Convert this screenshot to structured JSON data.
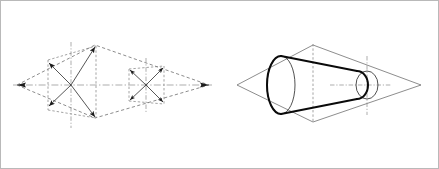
{
  "page": {
    "background_color": "#ffffff",
    "border_color": "#b9b9b9",
    "width": 439,
    "height": 169
  },
  "figures": [
    {
      "id": "figure-left",
      "name": "rhombus-with-inscribed-square-crosses",
      "description": "Isometric rhombus outline containing two dashed squares, each with a four-arrow diagonal cross and dash-dot centerlines",
      "line_color": "#6f6f6f",
      "arrow_color": "#1c1c1c",
      "outline": {
        "type": "rhombus",
        "style": "dashed",
        "vertices": [
          {
            "label": "left",
            "x": 17,
            "y": 85
          },
          {
            "label": "top",
            "x": 95,
            "y": 45
          },
          {
            "label": "right",
            "x": 209,
            "y": 85
          },
          {
            "label": "bottom",
            "x": 95,
            "y": 118
          }
        ]
      },
      "axes": [
        {
          "label": "horizontal-axis",
          "style": "dash-dot",
          "x1": 17,
          "y1": 85,
          "x2": 209,
          "y2": 85
        },
        {
          "label": "vertical-axis-large",
          "style": "dash-dot",
          "x1": 71,
          "y1": 44,
          "x2": 71,
          "y2": 126
        },
        {
          "label": "vertical-axis-small",
          "style": "dash-dot",
          "x1": 146,
          "y1": 59,
          "x2": 146,
          "y2": 112
        }
      ],
      "squares": [
        {
          "label": "large-square",
          "style": "dashed",
          "x": 48,
          "y": 58,
          "width": 48,
          "height": 54,
          "cross": {
            "style": "solid-with-arrowheads",
            "arrow_count": 4,
            "diagonals": [
              {
                "from": {
                  "x": 71,
                  "y": 85
                },
                "to": {
                  "x": 96,
                  "y": 46
                }
              },
              {
                "from": {
                  "x": 71,
                  "y": 85
                },
                "to": {
                  "x": 48,
                  "y": 63
                }
              },
              {
                "from": {
                  "x": 71,
                  "y": 85
                },
                "to": {
                  "x": 96,
                  "y": 118
                }
              },
              {
                "from": {
                  "x": 71,
                  "y": 85
                },
                "to": {
                  "x": 48,
                  "y": 106
                }
              }
            ]
          }
        },
        {
          "label": "small-square",
          "style": "dashed",
          "x": 128,
          "y": 66,
          "width": 36,
          "height": 39,
          "cross": {
            "style": "solid-with-arrowheads",
            "arrow_count": 4,
            "diagonals": [
              {
                "from": {
                  "x": 146,
                  "y": 85
                },
                "to": {
                  "x": 164,
                  "y": 67
                }
              },
              {
                "from": {
                  "x": 146,
                  "y": 85
                },
                "to": {
                  "x": 129,
                  "y": 69
                }
              },
              {
                "from": {
                  "x": 146,
                  "y": 85
                },
                "to": {
                  "x": 164,
                  "y": 103
                }
              },
              {
                "from": {
                  "x": 146,
                  "y": 85
                },
                "to": {
                  "x": 129,
                  "y": 101
                }
              }
            ]
          }
        }
      ],
      "vertex_arrow_tips": [
        {
          "x": 17,
          "y": 85,
          "direction": "left"
        },
        {
          "x": 209,
          "y": 85,
          "direction": "right"
        }
      ]
    },
    {
      "id": "figure-right",
      "name": "truncated-cone-in-rhombus",
      "description": "Heavy-outlined truncated cone (frustum) seen in isometric, inscribed in a light rhombus plane, with dash-dot crosshair centers at both circular ends",
      "line_color": "#7d7d7d",
      "body_color": "#0a0a0a",
      "outline": {
        "type": "rhombus",
        "style": "solid-thin",
        "vertices": [
          {
            "label": "left",
            "x": 237,
            "y": 85
          },
          {
            "label": "top",
            "x": 313,
            "y": 45
          },
          {
            "label": "right",
            "x": 421,
            "y": 85
          },
          {
            "label": "bottom",
            "x": 313,
            "y": 122
          }
        ]
      },
      "axes": [
        {
          "label": "horizontal-axis",
          "style": "dash-dot",
          "x1": 312,
          "y1": 85,
          "x2": 386,
          "y2": 85
        },
        {
          "label": "vertical-axis-major",
          "style": "dashed",
          "x1": 313,
          "y1": 44,
          "x2": 313,
          "y2": 123
        },
        {
          "label": "vertical-axis-minor",
          "style": "dash-dot",
          "x1": 367,
          "y1": 56,
          "x2": 367,
          "y2": 115
        }
      ],
      "solid": {
        "type": "truncated-cone",
        "large_end": {
          "label": "base-ellipse",
          "cx": 281,
          "cy": 85,
          "rx": 14,
          "ry": 29
        },
        "small_end": {
          "label": "top-circle",
          "cx": 367,
          "cy": 85,
          "rx": 11,
          "ry": 14
        },
        "hidden_edges": "dashed-rear-ellipse",
        "style": "heavy-outline"
      },
      "crosshairs": [
        {
          "label": "small-end-crosshair",
          "cx": 367,
          "cy": 85,
          "half_w": 22,
          "half_h": 25
        }
      ]
    }
  ],
  "legend": {
    "line_types": [
      {
        "name": "visible-outline",
        "style": "heavy solid"
      },
      {
        "name": "construction-line",
        "style": "thin dashed"
      },
      {
        "name": "centerline",
        "style": "dash-dot"
      },
      {
        "name": "direction-arrow",
        "style": "solid with arrowhead"
      }
    ]
  }
}
